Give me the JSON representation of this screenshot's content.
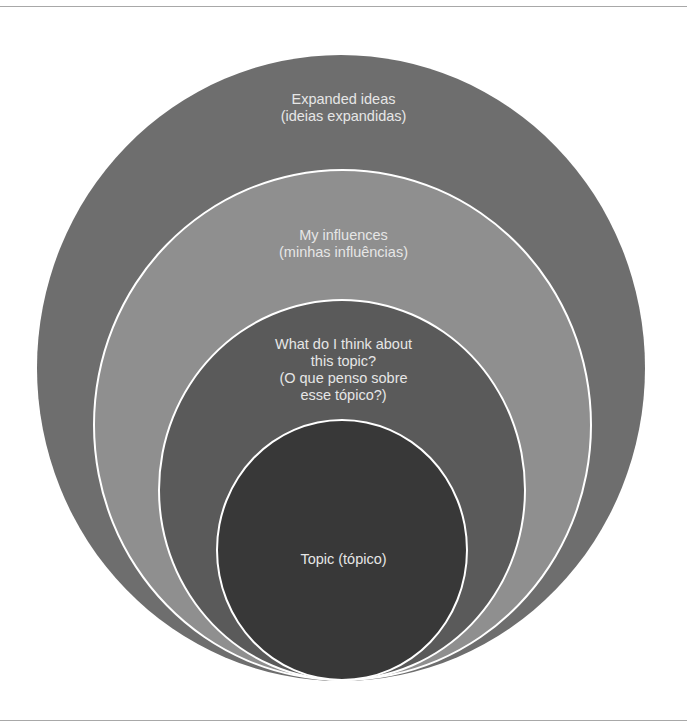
{
  "diagram": {
    "type": "nested-circles",
    "colors": {
      "ring_1": "#6e6e6e",
      "ring_2": "#8f8f8f",
      "ring_3": "#5a5a5a",
      "ring_4": "#383838",
      "separator": "#ffffff",
      "text": "#e6e6e6"
    },
    "layers": [
      {
        "level": "outer",
        "lines": [
          "Expanded ideas",
          "(ideias expandidas)"
        ]
      },
      {
        "level": "second",
        "lines": [
          "My influences",
          "(minhas influências)"
        ]
      },
      {
        "level": "third",
        "lines": [
          "What do I think about",
          "this topic?",
          "(O que penso sobre",
          "esse tópico?)"
        ]
      },
      {
        "level": "core",
        "lines": [
          "Topic (tópico)"
        ]
      }
    ]
  }
}
